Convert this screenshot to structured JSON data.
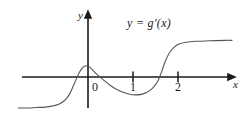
{
  "chart_data": {
    "type": "line",
    "title": "",
    "subtitle": "",
    "xlabel": "x",
    "ylabel": "y",
    "curve_label": "y = g′(x)",
    "xlim": [
      -1.55,
      3.2
    ],
    "ylim": [
      -1.0,
      1.0
    ],
    "grid": false,
    "legend_position": "inside-top-right",
    "axis_color": "#1a1a1a",
    "curve_color": "#555555",
    "background_color": "#ffffff",
    "x_ticks": [
      {
        "value": 0,
        "label": "0",
        "drawn_mark": false
      },
      {
        "value": 1,
        "label": "1",
        "drawn_mark": true
      },
      {
        "value": 2,
        "label": "2",
        "drawn_mark": true
      }
    ],
    "y_ticks": [],
    "annotations": [
      {
        "text": "y = g′(x)",
        "x": 1.0,
        "y": 0.82
      }
    ],
    "features": [
      {
        "kind": "left-asymptote",
        "y": -0.66,
        "description": "flat tail below axis on far left"
      },
      {
        "kind": "local-maximum",
        "x": -0.05,
        "y": 0.24
      },
      {
        "kind": "x-intercept",
        "x": 0.0
      },
      {
        "kind": "x-intercept",
        "x": 0.27
      },
      {
        "kind": "local-minimum",
        "x": 1.05,
        "y": -0.38
      },
      {
        "kind": "x-intercept",
        "x": 1.63
      },
      {
        "kind": "right-asymptote",
        "y": 0.78,
        "description": "flat tail above axis on far right"
      }
    ],
    "series": [
      {
        "name": "y = g′(x)",
        "x": [
          -1.55,
          -1.35,
          -1.15,
          -0.95,
          -0.8,
          -0.65,
          -0.52,
          -0.42,
          -0.34,
          -0.26,
          -0.19,
          -0.13,
          -0.08,
          -0.04,
          0.0,
          0.05,
          0.11,
          0.18,
          0.27,
          0.38,
          0.5,
          0.63,
          0.76,
          0.9,
          1.05,
          1.18,
          1.3,
          1.4,
          1.48,
          1.55,
          1.6,
          1.66,
          1.72,
          1.8,
          1.9,
          2.02,
          2.18,
          2.4,
          2.7,
          3.05,
          3.2
        ],
        "y": [
          -0.66,
          -0.66,
          -0.65,
          -0.64,
          -0.62,
          -0.58,
          -0.5,
          -0.38,
          -0.22,
          -0.04,
          0.1,
          0.19,
          0.23,
          0.24,
          0.23,
          0.2,
          0.14,
          0.07,
          0.0,
          -0.09,
          -0.18,
          -0.26,
          -0.32,
          -0.36,
          -0.38,
          -0.37,
          -0.33,
          -0.27,
          -0.19,
          -0.09,
          0.02,
          0.18,
          0.34,
          0.5,
          0.62,
          0.7,
          0.74,
          0.76,
          0.77,
          0.78,
          0.78
        ]
      }
    ]
  },
  "axes": {
    "y_axis_label": "y",
    "x_axis_label": "x"
  },
  "labels": {
    "tick_0": "0",
    "tick_1": "1",
    "tick_2": "2",
    "equation": "y = g′(x)"
  }
}
